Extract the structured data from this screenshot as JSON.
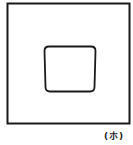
{
  "figure": {
    "label": "(ホ)",
    "stroke_color": "#1a1a1a",
    "background": "#ffffff",
    "shapes": [
      {
        "name": "outer-square",
        "type": "rect"
      },
      {
        "name": "inner-rounded-square",
        "type": "rounded-rect"
      }
    ]
  }
}
